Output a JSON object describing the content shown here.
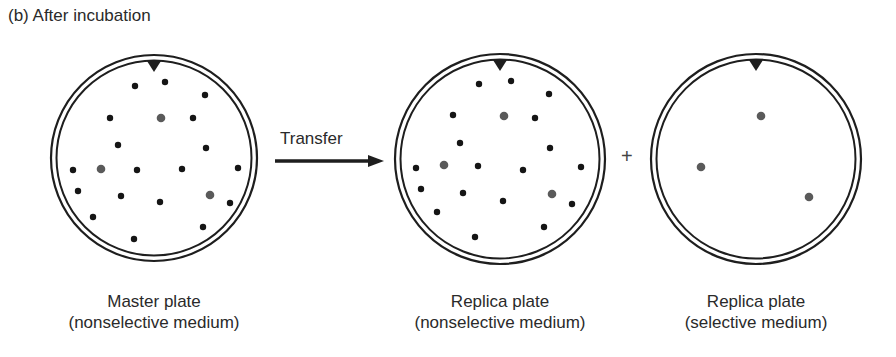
{
  "heading": "(b) After incubation",
  "transfer_label": "Transfer",
  "plus_sign": "+",
  "colors": {
    "line": "#1e1e1e",
    "colony_black": "#151515",
    "colony_gray": "#5a5a5a"
  },
  "plates": [
    {
      "id": "master",
      "cx": 154,
      "cy": 158,
      "r": 103,
      "title": "Master plate",
      "subtitle": "(nonselective medium)",
      "label_x": 154,
      "colonies": [
        [
          135,
          86,
          "b"
        ],
        [
          165,
          82,
          "b"
        ],
        [
          205,
          95,
          "b"
        ],
        [
          110,
          118,
          "b"
        ],
        [
          161,
          118,
          "g"
        ],
        [
          193,
          118,
          "b"
        ],
        [
          118,
          145,
          "b"
        ],
        [
          206,
          148,
          "b"
        ],
        [
          73,
          170,
          "b"
        ],
        [
          101,
          169,
          "g"
        ],
        [
          137,
          170,
          "b"
        ],
        [
          182,
          169,
          "b"
        ],
        [
          238,
          168,
          "b"
        ],
        [
          78,
          191,
          "b"
        ],
        [
          121,
          196,
          "b"
        ],
        [
          160,
          202,
          "b"
        ],
        [
          210,
          195,
          "g"
        ],
        [
          230,
          203,
          "b"
        ],
        [
          93,
          217,
          "b"
        ],
        [
          203,
          227,
          "b"
        ],
        [
          134,
          239,
          "b"
        ]
      ]
    },
    {
      "id": "replica-nonselective",
      "cx": 500,
      "cy": 159,
      "r": 105,
      "title": "Replica plate",
      "subtitle": "(nonselective medium)",
      "label_x": 500,
      "colonies": [
        [
          479,
          84,
          "b"
        ],
        [
          511,
          81,
          "b"
        ],
        [
          549,
          94,
          "b"
        ],
        [
          453,
          115,
          "b"
        ],
        [
          504,
          116,
          "g"
        ],
        [
          535,
          118,
          "b"
        ],
        [
          460,
          143,
          "b"
        ],
        [
          550,
          148,
          "b"
        ],
        [
          416,
          168,
          "b"
        ],
        [
          444,
          165,
          "g"
        ],
        [
          478,
          166,
          "b"
        ],
        [
          523,
          170,
          "b"
        ],
        [
          581,
          167,
          "b"
        ],
        [
          421,
          189,
          "b"
        ],
        [
          463,
          193,
          "b"
        ],
        [
          503,
          201,
          "b"
        ],
        [
          552,
          194,
          "g"
        ],
        [
          572,
          204,
          "b"
        ],
        [
          437,
          212,
          "b"
        ],
        [
          544,
          227,
          "b"
        ],
        [
          475,
          237,
          "b"
        ]
      ]
    },
    {
      "id": "replica-selective",
      "cx": 756,
      "cy": 159,
      "r": 105,
      "title": "Replica plate",
      "subtitle": "(selective medium)",
      "label_x": 756,
      "colonies": [
        [
          761,
          116,
          "g"
        ],
        [
          701,
          167,
          "g"
        ],
        [
          809,
          197,
          "g"
        ]
      ]
    }
  ]
}
